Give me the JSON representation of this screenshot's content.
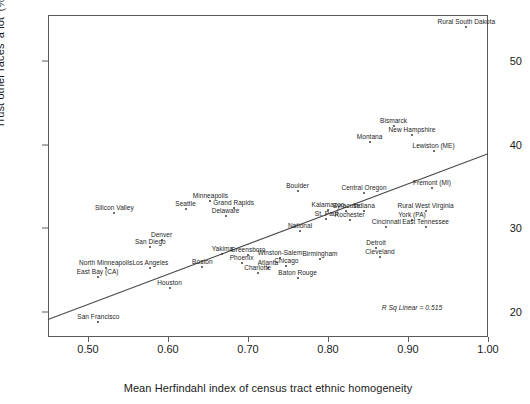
{
  "chart_data": {
    "type": "scatter",
    "title": "",
    "xlabel": "Mean Herfindahl index of census tract ethnic homogeneity",
    "ylabel": "Trust other races 'a lot' (%)",
    "xlim": [
      0.45,
      1.0
    ],
    "ylim": [
      17.0,
      55.5
    ],
    "xticks": [
      "0.50",
      "0.60",
      "0.70",
      "0.80",
      "0.90",
      "1.00"
    ],
    "xtick_values": [
      0.5,
      0.6,
      0.7,
      0.8,
      0.9,
      1.0
    ],
    "yticks": [
      "20",
      "30",
      "40",
      "50"
    ],
    "ytick_values": [
      20,
      30,
      40,
      50
    ],
    "grid": false,
    "legend": null,
    "annotations": [
      {
        "text": "R Sq Linear = 0.515",
        "x": 0.905,
        "y": 20.6
      }
    ],
    "fit_line": {
      "type": "linear",
      "x_start": 0.45,
      "y_start": 19.1,
      "x_end": 1.0,
      "y_end": 38.9
    },
    "points": [
      {
        "label": "Rural South Dakota",
        "x": 0.973,
        "y": 54.1,
        "label_pos": "above"
      },
      {
        "label": "Bismarck",
        "x": 0.882,
        "y": 42.2,
        "label_pos": "above"
      },
      {
        "label": "New Hampshire",
        "x": 0.905,
        "y": 41.1,
        "label_pos": "above"
      },
      {
        "label": "Montana",
        "x": 0.852,
        "y": 40.3,
        "label_pos": "above"
      },
      {
        "label": "Lewiston (ME)",
        "x": 0.932,
        "y": 39.2,
        "label_pos": "above"
      },
      {
        "label": "Fremont (MI)",
        "x": 0.93,
        "y": 34.8,
        "label_pos": "above"
      },
      {
        "label": "Central Oregon",
        "x": 0.845,
        "y": 34.2,
        "label_pos": "above"
      },
      {
        "label": "Boulder",
        "x": 0.762,
        "y": 34.4,
        "label_pos": "above"
      },
      {
        "label": "Rural West Virginia",
        "x": 0.922,
        "y": 32.1,
        "label_pos": "above"
      },
      {
        "label": "York (PA)",
        "x": 0.905,
        "y": 31.0,
        "label_pos": "above"
      },
      {
        "label": "Kalamazoo",
        "x": 0.8,
        "y": 32.2,
        "label_pos": "above"
      },
      {
        "label": "Syracuse",
        "x": 0.823,
        "y": 32.1,
        "label_pos": "above"
      },
      {
        "label": "Indiana",
        "x": 0.845,
        "y": 32.1,
        "label_pos": "above"
      },
      {
        "label": "St. Paul",
        "x": 0.798,
        "y": 31.1,
        "label_pos": "above"
      },
      {
        "label": "Rochester",
        "x": 0.827,
        "y": 31.0,
        "label_pos": "above"
      },
      {
        "label": "Minneapolis",
        "x": 0.653,
        "y": 33.3,
        "label_pos": "above"
      },
      {
        "label": "Grand Rapids",
        "x": 0.682,
        "y": 32.4,
        "label_pos": "above"
      },
      {
        "label": "Delaware",
        "x": 0.672,
        "y": 31.5,
        "label_pos": "above"
      },
      {
        "label": "Seattle",
        "x": 0.622,
        "y": 32.3,
        "label_pos": "above"
      },
      {
        "label": "Silicon Valley",
        "x": 0.533,
        "y": 31.8,
        "label_pos": "above"
      },
      {
        "label": "Cincinnati",
        "x": 0.873,
        "y": 30.2,
        "label_pos": "above"
      },
      {
        "label": "East Tennessee",
        "x": 0.922,
        "y": 30.1,
        "label_pos": "above"
      },
      {
        "label": "National",
        "x": 0.765,
        "y": 29.7,
        "label_pos": "above"
      },
      {
        "label": "Denver",
        "x": 0.592,
        "y": 28.6,
        "label_pos": "above"
      },
      {
        "label": "San Diego",
        "x": 0.578,
        "y": 27.8,
        "label_pos": "above"
      },
      {
        "label": "Detroit",
        "x": 0.86,
        "y": 27.6,
        "label_pos": "above"
      },
      {
        "label": "Cleveland",
        "x": 0.865,
        "y": 26.6,
        "label_pos": "above"
      },
      {
        "label": "Birmingham",
        "x": 0.79,
        "y": 26.3,
        "label_pos": "above"
      },
      {
        "label": "Greensboro",
        "x": 0.7,
        "y": 26.8,
        "label_pos": "above"
      },
      {
        "label": "Winston-Salem",
        "x": 0.74,
        "y": 26.5,
        "label_pos": "above"
      },
      {
        "label": "Yakima",
        "x": 0.668,
        "y": 26.9,
        "label_pos": "above"
      },
      {
        "label": "Phoenix",
        "x": 0.692,
        "y": 25.8,
        "label_pos": "above"
      },
      {
        "label": "Atlanta",
        "x": 0.725,
        "y": 25.3,
        "label_pos": "above"
      },
      {
        "label": "Chicago",
        "x": 0.748,
        "y": 25.5,
        "label_pos": "above"
      },
      {
        "label": "Charlotte",
        "x": 0.712,
        "y": 24.6,
        "label_pos": "above"
      },
      {
        "label": "Baton Rouge",
        "x": 0.762,
        "y": 24.0,
        "label_pos": "above"
      },
      {
        "label": "Boston",
        "x": 0.643,
        "y": 25.4,
        "label_pos": "above"
      },
      {
        "label": "North Minneapolis",
        "x": 0.522,
        "y": 25.2,
        "label_pos": "above"
      },
      {
        "label": "Los Angeles",
        "x": 0.578,
        "y": 25.2,
        "label_pos": "above"
      },
      {
        "label": "East Bay (CA)",
        "x": 0.512,
        "y": 24.2,
        "label_pos": "above"
      },
      {
        "label": "Houston",
        "x": 0.602,
        "y": 22.9,
        "label_pos": "above"
      },
      {
        "label": "San Francisco",
        "x": 0.513,
        "y": 18.8,
        "label_pos": "above"
      }
    ]
  }
}
